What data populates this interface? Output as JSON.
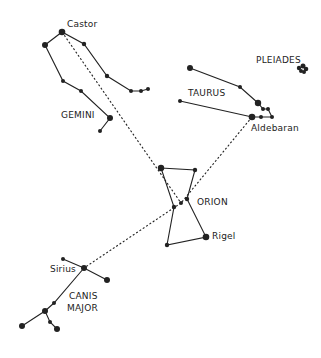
{
  "diagram": {
    "title": "",
    "constellations": [
      {
        "name": "GEMINI",
        "star_label": "Castor"
      },
      {
        "name": "TAURUS",
        "star_label": "Aldebaran"
      },
      {
        "name": "PLEIADES"
      },
      {
        "name": "ORION",
        "star_label": "Rigel"
      },
      {
        "name": "CANIS MAJOR",
        "star_label": "Sirius"
      }
    ],
    "labels": {
      "castor": "Castor",
      "gemini": "GEMINI",
      "pleiades": "PLEIADES",
      "taurus": "TAURUS",
      "aldebaran": "Aldebaran",
      "orion": "ORION",
      "rigel": "Rigel",
      "sirius": "Sirius",
      "canis": "CANIS",
      "major": "MAJOR"
    },
    "colors": {
      "ink": "#222222",
      "background": "#ffffff"
    }
  }
}
